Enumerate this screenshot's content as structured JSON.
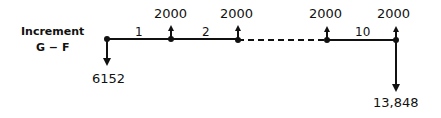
{
  "title": {
    "line1": "Increment",
    "line2": "G − F"
  },
  "periods": {
    "p1": "1",
    "p2": "2",
    "p10": "10"
  },
  "inflows": [
    "2000",
    "2000",
    "2000",
    "2000"
  ],
  "outflows": {
    "start": "6152",
    "end": "13,848"
  }
}
